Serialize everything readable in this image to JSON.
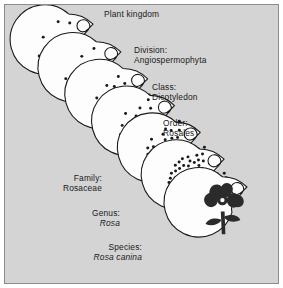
{
  "figure": {
    "kind": "taxonomic-hierarchy-diagram",
    "subject": "Rosa canina",
    "background_color": "#d4d4d4",
    "border_color": "#8c8c8c",
    "ink_color": "#1a1a1a",
    "circle_fill": "#fdfdfd",
    "flower_color": "#2b2b2b"
  },
  "ranks": [
    {
      "id": "kingdom",
      "rank_label": "Plant kingdom",
      "taxon_name": "",
      "italic_name": false,
      "label_align": "left",
      "dot_count": 14,
      "dot_radius": 1.5,
      "circle": {
        "cx": 64,
        "cy": 44,
        "r": 35
      }
    },
    {
      "id": "division",
      "rank_label": "Division:",
      "taxon_name": "Angiospermophyta",
      "italic_name": false,
      "label_align": "left",
      "dot_count": 18,
      "dot_radius": 1.5,
      "circle": {
        "cx": 92,
        "cy": 72,
        "r": 35
      }
    },
    {
      "id": "class",
      "rank_label": "Class:",
      "taxon_name": "Dicotyledon",
      "italic_name": false,
      "label_align": "left",
      "dot_count": 26,
      "dot_radius": 1.5,
      "circle": {
        "cx": 119,
        "cy": 99,
        "r": 35
      }
    },
    {
      "id": "order",
      "rank_label": "Order:",
      "taxon_name": "Rosales",
      "italic_name": false,
      "label_align": "left",
      "dot_count": 34,
      "dot_radius": 1.5,
      "circle": {
        "cx": 146,
        "cy": 126,
        "r": 35
      }
    },
    {
      "id": "family",
      "rank_label": "Family:",
      "taxon_name": "Rosaceae",
      "italic_name": false,
      "label_align": "right",
      "dot_count": 52,
      "dot_radius": 1.5,
      "circle": {
        "cx": 172,
        "cy": 153,
        "r": 35
      }
    },
    {
      "id": "genus",
      "rank_label": "Genus:",
      "taxon_name": "Rosa",
      "italic_name": true,
      "label_align": "right",
      "dot_count": 86,
      "dot_radius": 1.5,
      "circle": {
        "cx": 196,
        "cy": 180,
        "r": 35
      }
    },
    {
      "id": "species",
      "rank_label": "Species:",
      "taxon_name": "Rosa canina",
      "italic_name": true,
      "label_align": "right",
      "dot_count": 0,
      "dot_radius": 0,
      "circle": {
        "cx": 219,
        "cy": 208,
        "r": 35
      }
    }
  ],
  "labels": {
    "kingdom": {
      "line1": "Plant kingdom",
      "line2": ""
    },
    "division": {
      "line1": "Division:",
      "line2": "Angiospermophyta"
    },
    "class": {
      "line1": "Class:",
      "line2": "Dicotyledon"
    },
    "order": {
      "line1": "Order:",
      "line2": "Rosales"
    },
    "family": {
      "line1": "Family:",
      "line2": "Rosaceae"
    },
    "genus": {
      "line1": "Genus:",
      "line2": "Rosa"
    },
    "species": {
      "line1": "Species:",
      "line2": "Rosa canina"
    }
  }
}
